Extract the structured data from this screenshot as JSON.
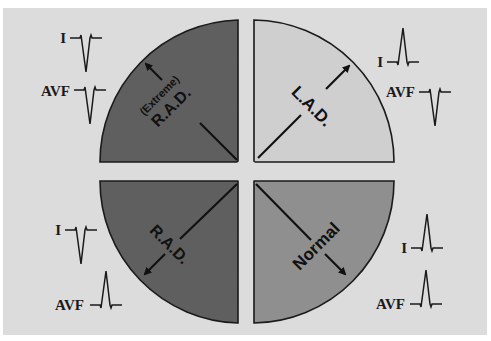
{
  "diagram": {
    "colors": {
      "panel_background": "#dcdcdc",
      "extreme_rad_fill": "#5f5f5f",
      "lad_fill": "#cfcfcf",
      "rad_fill": "#5f5f5f",
      "normal_fill": "#8f8f8f",
      "ink": "#1a1a1a"
    },
    "quadrants": [
      {
        "id": "extreme-rad",
        "position": "top-left",
        "label_line1": "(Extreme)",
        "label_line2": "R.A.D.",
        "leads": [
          {
            "name": "I",
            "deflection": "negative"
          },
          {
            "name": "AVF",
            "deflection": "negative"
          }
        ]
      },
      {
        "id": "lad",
        "position": "top-right",
        "label": "L.A.D.",
        "leads": [
          {
            "name": "I",
            "deflection": "positive"
          },
          {
            "name": "AVF",
            "deflection": "negative"
          }
        ]
      },
      {
        "id": "rad",
        "position": "bottom-left",
        "label": "R.A.D.",
        "leads": [
          {
            "name": "I",
            "deflection": "negative"
          },
          {
            "name": "AVF",
            "deflection": "positive"
          }
        ]
      },
      {
        "id": "normal",
        "position": "bottom-right",
        "label": "Normal",
        "leads": [
          {
            "name": "I",
            "deflection": "positive"
          },
          {
            "name": "AVF",
            "deflection": "positive"
          }
        ]
      }
    ]
  }
}
